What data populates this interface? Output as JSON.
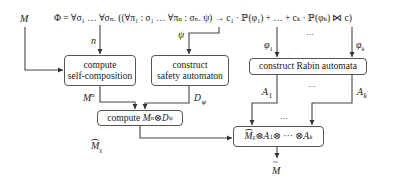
{
  "inputs": {
    "model": "M",
    "formula": "Φ = ∀σ₁ … ∀σₙ. ((∀π₁ : σ₁ … ∀πₙ : σₙ. ψ) → c₁ · ℙ(φ₁) + … + cₖ · ℙ(φₖ) ⋈ c)"
  },
  "edge_labels": {
    "n": "n",
    "psi": "ψ",
    "phi1": "φ",
    "phi1_sub": "1",
    "phik": "φ",
    "phik_sub": "k",
    "Mn": "M",
    "Mn_sup": "n",
    "Dpsi": "D",
    "Dpsi_sub": "ψ",
    "A1": "A",
    "A1_sub": "1",
    "Ak": "A",
    "Ak_sub": "k",
    "Mchi": "M",
    "Mchi_sub": "χ",
    "dots_top": "…",
    "dots_mid": "…",
    "output": "M"
  },
  "boxes": {
    "self_composition": {
      "line1": "compute",
      "line2": "self-composition"
    },
    "safety_automaton": {
      "line1": "construct",
      "line2": "safety automaton"
    },
    "rabin": {
      "label": "construct Rabin automata"
    },
    "product_Dpsi": {
      "prefix": "compute ",
      "M": "M",
      "sup": "n",
      "otimes": " ⊗ ",
      "D": "D",
      "sub": "ψ"
    },
    "final_product": {
      "M": "M",
      "Msub": "χ",
      "o1": " ⊗ ",
      "A1": "A",
      "A1sub": "1",
      "o2": " ⊗ ··· ⊗ ",
      "Ak": "A",
      "Aksub": "k"
    }
  },
  "colors": {
    "line": "#444444",
    "box_border": "#555555",
    "text": "#222222"
  }
}
